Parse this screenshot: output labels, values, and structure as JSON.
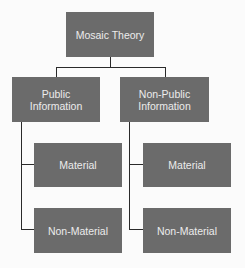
{
  "diagram": {
    "type": "hierarchy",
    "colors": {
      "node_fill": "#6b6b6b",
      "node_text": "#ececec",
      "connector": "#2a2a2a",
      "background": "#fbfbfb"
    },
    "root": {
      "label": "Mosaic Theory"
    },
    "branches": [
      {
        "label": "Public Information",
        "children": [
          {
            "label": "Material"
          },
          {
            "label": "Non-Material"
          }
        ]
      },
      {
        "label": "Non-Public Information",
        "children": [
          {
            "label": "Material"
          },
          {
            "label": "Non-Material"
          }
        ]
      }
    ]
  }
}
